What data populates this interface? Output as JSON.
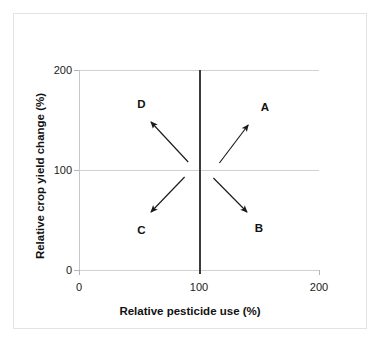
{
  "chart_data": {
    "type": "scatter",
    "title": "",
    "xlabel": "Relative pesticide use (%)",
    "ylabel": "Relative crop yield change (%)",
    "xlim": [
      0,
      200
    ],
    "ylim": [
      0,
      200
    ],
    "xticks": [
      "0",
      "100",
      "200"
    ],
    "yticks": [
      "0",
      "100",
      "200"
    ],
    "grid": "horizontal reference line at y=100, vertical reference line at x=100",
    "legend": "none",
    "reference_lines": [
      {
        "name": "vertical-reference-line",
        "axis": "x",
        "value": 100,
        "color": "#3a3a3a",
        "emphasis": "bold"
      },
      {
        "name": "horizontal-reference-line",
        "axis": "y",
        "value": 100,
        "color": "#d0d0d0",
        "emphasis": "light"
      }
    ],
    "origin": {
      "x": 100,
      "y": 100
    },
    "annotations": [
      {
        "label": "A",
        "quadrant": "upper-right",
        "direction": "up-right",
        "meaning": "increased pesticide use, increased yield",
        "arrow": {
          "x1": 117,
          "y1": 107,
          "x2": 141,
          "y2": 145
        },
        "label_pos": {
          "x": 155,
          "y": 163
        }
      },
      {
        "label": "B",
        "quadrant": "lower-right",
        "direction": "down-right",
        "meaning": "increased pesticide use, decreased yield",
        "arrow": {
          "x1": 112,
          "y1": 92,
          "x2": 140,
          "y2": 58
        },
        "label_pos": {
          "x": 150,
          "y": 42
        }
      },
      {
        "label": "C",
        "quadrant": "lower-left",
        "direction": "down-left",
        "meaning": "decreased pesticide use, decreased yield",
        "arrow": {
          "x1": 88,
          "y1": 93,
          "x2": 60,
          "y2": 58
        },
        "label_pos": {
          "x": 52,
          "y": 40
        }
      },
      {
        "label": "D",
        "quadrant": "upper-left",
        "direction": "up-left",
        "meaning": "decreased pesticide use, increased yield",
        "arrow": {
          "x1": 91,
          "y1": 108,
          "x2": 60,
          "y2": 148
        },
        "label_pos": {
          "x": 52,
          "y": 166
        }
      }
    ]
  },
  "axes": {
    "x": {
      "title": "Relative pesticide use (%)",
      "ticks": [
        {
          "value": "0"
        },
        {
          "value": "100"
        },
        {
          "value": "200"
        }
      ]
    },
    "y": {
      "title": "Relative crop yield change (%)",
      "ticks": [
        {
          "value": "200"
        },
        {
          "value": "100"
        },
        {
          "value": "0"
        }
      ]
    }
  },
  "quadrants": [
    {
      "label": "A"
    },
    {
      "label": "B"
    },
    {
      "label": "C"
    },
    {
      "label": "D"
    }
  ]
}
